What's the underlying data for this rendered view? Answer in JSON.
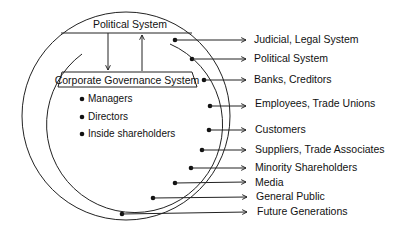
{
  "diagram": {
    "type": "stakeholder-circles",
    "colors": {
      "line": "#222222",
      "text": "#111111",
      "background": "#ffffff"
    },
    "inner_system": {
      "top_box_label": "Political System",
      "bottom_box_label": "Corporate Governance System",
      "arrows": [
        {
          "from": "Political System",
          "to": "Corporate Governance System",
          "direction": "down"
        },
        {
          "from": "Corporate Governance System",
          "to": "Political System",
          "direction": "up"
        }
      ],
      "internal_members": [
        "Managers",
        "Directors",
        "Inside shareholders"
      ]
    },
    "external_stakeholders": [
      "Judicial, Legal System",
      "Political System",
      "Banks, Creditors",
      "Employees, Trade Unions",
      "Customers",
      "Suppliers, Trade Associates",
      "Minority Shareholders",
      "Media",
      "General Public",
      "Future Generations"
    ]
  }
}
